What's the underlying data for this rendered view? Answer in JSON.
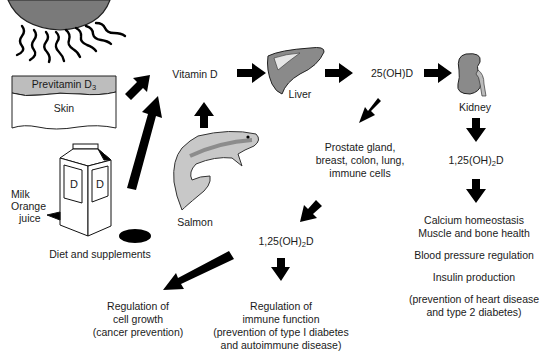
{
  "diagram": {
    "sources": {
      "skin": {
        "layer_top": "Previtamin D",
        "layer_top_sub": "3",
        "layer_bottom": "Skin"
      },
      "diet": {
        "milk_label": "Milk",
        "oj_label1": "Orange",
        "oj_label2": "juice",
        "carton_letter": "D",
        "caption": "Diet and supplements"
      },
      "fish": {
        "caption": "Salmon"
      }
    },
    "nodes": {
      "vitamin_d": "Vitamin D",
      "liver": "Liver",
      "calcidiol": "25(OH)D",
      "kidney": "Kidney",
      "calcitriol_kidney": {
        "pre": "1,25(OH)",
        "sub": "2",
        "post": "D"
      },
      "tissues": [
        "Prostate gland,",
        "breast, colon, lung,",
        "immune cells"
      ],
      "calcitriol_local": {
        "pre": "1,25(OH)",
        "sub": "2",
        "post": "D"
      }
    },
    "outcomes": {
      "kidney_effects": [
        "Calcium homeostasis",
        "Muscle and bone health",
        "Blood pressure regulation",
        "Insulin production",
        "(prevention of heart disease",
        "and type 2 diabetes)"
      ],
      "cell_growth": [
        "Regulation of",
        "cell growth",
        "(cancer prevention)"
      ],
      "immune": [
        "Regulation of",
        "immune function",
        "(prevention of type I diabetes",
        "and autoimmune disease)"
      ]
    },
    "colors": {
      "sun": "#7a7a7a",
      "organ": "#8a8a8a",
      "previtamin": "#bdbdbd",
      "fish": "#c8c8c8",
      "arrow": "#000000"
    }
  }
}
